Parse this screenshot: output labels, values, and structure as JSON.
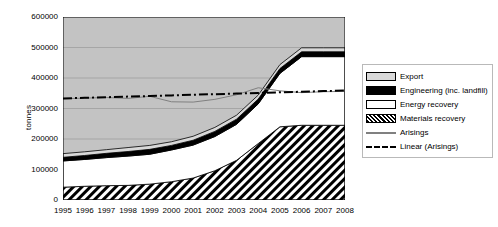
{
  "chart_data": {
    "type": "area",
    "title": "",
    "subtitle": "",
    "xlabel": "",
    "ylabel": "tonnes",
    "stacked": true,
    "grid": true,
    "legend_position": "right",
    "xlim": [
      1995,
      2008
    ],
    "ylim": [
      0,
      600000
    ],
    "yticks": [
      0,
      100000,
      200000,
      300000,
      400000,
      500000,
      600000
    ],
    "ytick_labels": [
      "0",
      "100000",
      "200000",
      "300000",
      "400000",
      "500000",
      "600000"
    ],
    "categories": [
      1995,
      1996,
      1997,
      1998,
      1999,
      2000,
      2001,
      2002,
      2003,
      2004,
      2005,
      2006,
      2007,
      2008
    ],
    "xtick_labels": [
      "1995",
      "1996",
      "1997",
      "1998",
      "1999",
      "2000",
      "2001",
      "2002",
      "2003",
      "2004",
      "2005",
      "2006",
      "2007",
      "2008"
    ],
    "series": [
      {
        "name": "Materials recovery",
        "kind": "area",
        "stack_order": 1,
        "fill": "diagonal-hatch",
        "color": "#000000",
        "values": [
          42000,
          45000,
          47000,
          48000,
          52000,
          60000,
          72000,
          96000,
          130000,
          185000,
          240000,
          245000,
          245000,
          245000
        ]
      },
      {
        "name": "Energy recovery",
        "kind": "area",
        "stack_order": 2,
        "fill": "solid",
        "color": "#ffffff",
        "values": [
          86000,
          88000,
          92000,
          96000,
          98000,
          104000,
          108000,
          112000,
          118000,
          130000,
          175000,
          225000,
          225000,
          225000
        ]
      },
      {
        "name": "Engineering (inc. landfill)",
        "kind": "area",
        "stack_order": 3,
        "fill": "solid",
        "color": "#000000",
        "values": [
          12000,
          13000,
          14000,
          15000,
          16000,
          15000,
          16000,
          17000,
          17000,
          16000,
          16000,
          16000,
          16000,
          16000
        ]
      },
      {
        "name": "Export",
        "kind": "area",
        "stack_order": 4,
        "fill": "solid",
        "color": "#d9d9d9",
        "values": [
          12000,
          12000,
          12000,
          13000,
          13000,
          12000,
          13000,
          13000,
          13000,
          13000,
          13000,
          13000,
          13000,
          13000
        ]
      },
      {
        "name": "Arisings",
        "kind": "line",
        "style": "solid",
        "color": "#808080",
        "values": [
          332000,
          334000,
          336000,
          333000,
          340000,
          322000,
          321000,
          330000,
          345000,
          368000,
          358000,
          352000,
          355000,
          356000
        ]
      },
      {
        "name": "Linear (Arisings)",
        "kind": "line",
        "style": "dash-dot",
        "color": "#000000",
        "values": [
          333000,
          335000,
          337000,
          339000,
          341000,
          343000,
          345000,
          347000,
          349000,
          351000,
          353000,
          355000,
          357000,
          359000
        ]
      }
    ],
    "totals": [
      152000,
      158000,
      165000,
      172000,
      179000,
      191000,
      209000,
      238000,
      278000,
      344000,
      444000,
      499000,
      499000,
      499000
    ]
  },
  "legend": {
    "items": [
      {
        "label": "Export",
        "key": "swatch-export"
      },
      {
        "label": "Engineering (inc. landfill)",
        "key": "swatch-engineering"
      },
      {
        "label": "Energy recovery",
        "key": "swatch-energy-recovery"
      },
      {
        "label": "Materials recovery",
        "key": "swatch-materials-recovery"
      },
      {
        "label": "Arisings",
        "key": "line-arisings"
      },
      {
        "label": "Linear (Arisings)",
        "key": "line-linear-arisings"
      }
    ]
  },
  "colors": {
    "export_fill": "#d9d9d9",
    "engineering_fill": "#000000",
    "energy_fill": "#ffffff",
    "materials_fill": "#000000",
    "plot_background": "#c3c3c3",
    "gridline": "#9a9a9a",
    "arisings_line": "#808080",
    "trend_line": "#000000",
    "axis": "#000000",
    "legend_border": "#b9b9b9"
  }
}
